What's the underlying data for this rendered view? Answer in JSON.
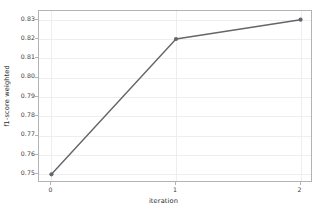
{
  "chart_data": {
    "type": "line",
    "title": "",
    "xlabel": "iteration",
    "ylabel": "f1-score weighted",
    "x": [
      0,
      1,
      2
    ],
    "values": [
      0.75,
      0.82,
      0.83
    ],
    "series": [
      {
        "name": "f1-score weighted",
        "values": [
          0.75,
          0.82,
          0.83
        ],
        "color": "#63666a",
        "marker": "circle",
        "linewidth": 1.4
      }
    ],
    "xlim": [
      -0.1,
      2.1
    ],
    "ylim": [
      0.7455,
      0.8345
    ],
    "xticks": [
      0,
      1,
      2
    ],
    "xtick_labels": [
      "0",
      "1",
      "2"
    ],
    "yticks": [
      0.75,
      0.76,
      0.77,
      0.78,
      0.79,
      0.8,
      0.81,
      0.82,
      0.83
    ],
    "ytick_labels": [
      "0.75",
      "0.76",
      "0.77",
      "0.78",
      "0.79",
      "0.80",
      "0.81",
      "0.82",
      "0.83"
    ],
    "grid": true,
    "grid_color": "#eeeeee",
    "legend": null,
    "legend_position": "none",
    "background": "#ffffff",
    "axes_edge_color": "#b3b3b3"
  }
}
